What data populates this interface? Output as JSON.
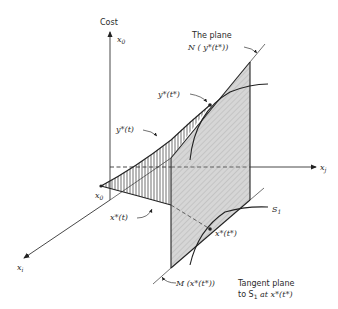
{
  "axes": {
    "vertical_title": "Cost",
    "vertical_label": "x",
    "vertical_sub": "0",
    "horizontal_label": "x",
    "horizontal_sub": "j",
    "depth_label": "x",
    "depth_sub": "i"
  },
  "labels": {
    "plane_title": "The plane",
    "plane_n": "N ( y*(t*))",
    "y_star_t_star": "y*(t*)",
    "y_star_t": "y*(t)",
    "x0": "x",
    "x0_sub": "0",
    "x_star_t": "x*(t)",
    "x_star_t_star": "x*(t*)",
    "s1": "S",
    "s1_sub": "1",
    "m_plane": "M (x*(t*))",
    "tangent_line1": "Tangent plane",
    "tangent_line2_a": "to S",
    "tangent_line2_sub": "1",
    "tangent_line2_b": " at x*(t*)"
  },
  "colors": {
    "plane_fill": "#d4d4d4",
    "ink": "#222222"
  }
}
